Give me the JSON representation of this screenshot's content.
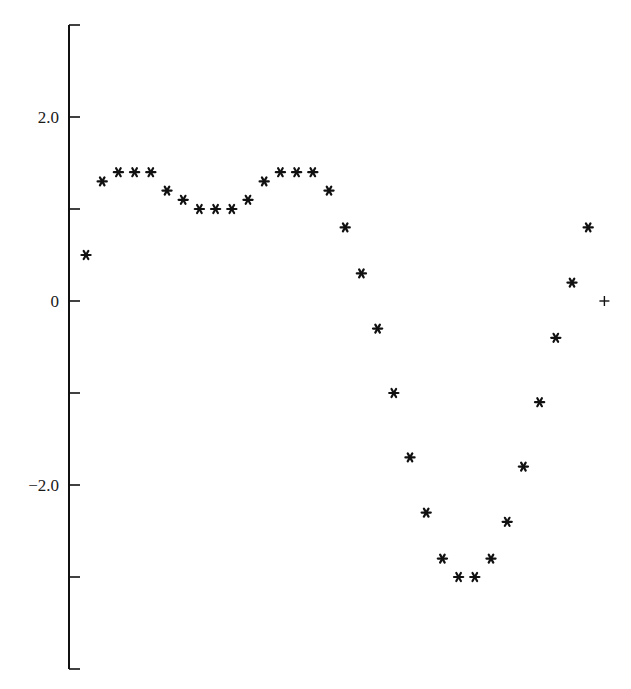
{
  "chart_data": {
    "type": "scatter",
    "title": "",
    "xlabel": "",
    "ylabel": "",
    "ylim": [
      -4,
      3
    ],
    "grid": false,
    "legend": null,
    "y_ticks": [
      3,
      2,
      1,
      0,
      -1,
      -2,
      -3,
      -4
    ],
    "y_tick_labels": [
      {
        "value": 2,
        "label": "2.0"
      },
      {
        "value": 0,
        "label": "0"
      },
      {
        "value": -2,
        "label": "-2.0"
      }
    ],
    "series": [
      {
        "name": "asterisk-series",
        "marker": "*",
        "x": [
          0,
          1,
          2,
          3,
          4,
          5,
          6,
          7,
          8,
          9,
          10,
          11,
          12,
          13,
          14,
          15,
          16,
          17,
          18,
          19,
          20,
          21,
          22,
          23,
          24,
          25,
          26,
          27,
          28,
          29,
          30,
          31
        ],
        "values": [
          0.5,
          1.3,
          1.4,
          1.4,
          1.4,
          1.2,
          1.1,
          1.0,
          1.0,
          1.0,
          1.1,
          1.3,
          1.4,
          1.4,
          1.4,
          1.2,
          0.8,
          0.3,
          -0.3,
          -1.0,
          -1.7,
          -2.3,
          -2.8,
          -3.0,
          -3.0,
          -2.8,
          -2.4,
          -1.8,
          -1.1,
          -0.4,
          0.2,
          0.8
        ]
      },
      {
        "name": "plus-series",
        "marker": "+",
        "x": [
          32
        ],
        "values": [
          0
        ]
      }
    ]
  },
  "layout": {
    "axis_x": 69,
    "y_zero_px": 301,
    "px_per_unit": 92,
    "x_start_px": 86,
    "x_step_px": 16.2,
    "tick_len": 11,
    "color": "#111111"
  }
}
